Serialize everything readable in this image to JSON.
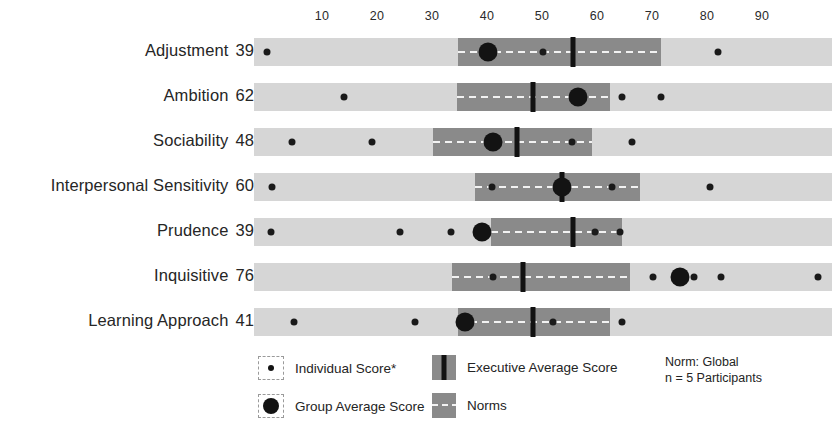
{
  "chart_data": {
    "type": "bar",
    "title": "",
    "xlabel": "",
    "ylabel": "",
    "xlim": [
      1,
      99
    ],
    "grid": false,
    "axis_ticks": [
      10,
      20,
      30,
      40,
      50,
      60,
      70,
      80,
      90
    ],
    "categories": [
      "Adjustment",
      "Ambition",
      "Sociability",
      "Interpersonal Sensitivity",
      "Prudence",
      "Inquisitive",
      "Learning Approach"
    ],
    "group_average_scores": [
      39,
      62,
      48,
      60,
      39,
      76,
      41
    ],
    "series": [
      {
        "name": "Group Average Score",
        "values": [
          39,
          62,
          48,
          60,
          39,
          76,
          41
        ]
      },
      {
        "name": "Norms band (start, end)",
        "values": [
          [
            47,
            84
          ],
          [
            47,
            75
          ],
          [
            42,
            71
          ],
          [
            50,
            80
          ],
          [
            53,
            77
          ],
          [
            46,
            78
          ],
          [
            47,
            75
          ]
        ]
      },
      {
        "name": "Executive Average Score",
        "values": [
          57,
          61,
          58,
          66,
          68,
          54,
          61
        ]
      },
      {
        "name": "Individual Score",
        "values": [
          [
            12,
            50,
            86
          ],
          [
            14,
            70,
            77
          ],
          [
            17,
            31,
            64
          ],
          [
            13,
            53,
            75,
            93
          ],
          [
            13,
            37,
            42,
            70
          ],
          [
            54,
            82,
            89,
            104
          ],
          [
            17,
            39,
            64,
            77
          ]
        ]
      }
    ]
  },
  "axis": {
    "ticks": [
      {
        "label": "10",
        "value": 10
      },
      {
        "label": "20",
        "value": 20
      },
      {
        "label": "30",
        "value": 30
      },
      {
        "label": "40",
        "value": 40
      },
      {
        "label": "50",
        "value": 50
      },
      {
        "label": "60",
        "value": 60
      },
      {
        "label": "70",
        "value": 70
      },
      {
        "label": "80",
        "value": 80
      },
      {
        "label": "90",
        "value": 90
      }
    ]
  },
  "rows": [
    {
      "label": "Adjustment",
      "score": "39",
      "band_px": [
        458,
        661
      ],
      "exec_px": 573,
      "group_px": 488,
      "individual_px": [
        267,
        543,
        718
      ]
    },
    {
      "label": "Ambition",
      "score": "62",
      "band_px": [
        457,
        610
      ],
      "exec_px": 533,
      "group_px": 578,
      "individual_px": [
        344,
        622,
        661
      ]
    },
    {
      "label": "Sociability",
      "score": "48",
      "band_px": [
        433,
        592
      ],
      "exec_px": 517,
      "group_px": 493,
      "individual_px": [
        292,
        372,
        572,
        632
      ]
    },
    {
      "label": "Interpersonal Sensitivity",
      "score": "60",
      "band_px": [
        475,
        640
      ],
      "exec_px": 562,
      "group_px": 562,
      "individual_px": [
        272,
        492,
        612,
        710
      ]
    },
    {
      "label": "Prudence",
      "score": "39",
      "band_px": [
        491,
        622
      ],
      "exec_px": 573,
      "group_px": 482,
      "individual_px": [
        271,
        400,
        451,
        595,
        620
      ]
    },
    {
      "label": "Inquisitive",
      "score": "76",
      "band_px": [
        452,
        630
      ],
      "exec_px": 523,
      "group_px": 680,
      "individual_px": [
        493,
        653,
        694,
        721,
        818
      ]
    },
    {
      "label": "Learning Approach",
      "score": "41",
      "band_px": [
        458,
        610
      ],
      "exec_px": 533,
      "group_px": 465,
      "individual_px": [
        294,
        415,
        553,
        622
      ]
    }
  ],
  "legend": {
    "individual_score": "Individual Score*",
    "group_average_score": "Group Average Score",
    "executive_average_score": "Executive Average Score",
    "norms": "Norms",
    "norm_line_1": "Norm: Global",
    "norm_line_2": "n = 5 Participants"
  },
  "colors": {
    "track": "#d6d6d6",
    "norm_band": "#8a8a8a",
    "exec_line": "#111111",
    "dot": "#131313",
    "text": "#262626"
  }
}
